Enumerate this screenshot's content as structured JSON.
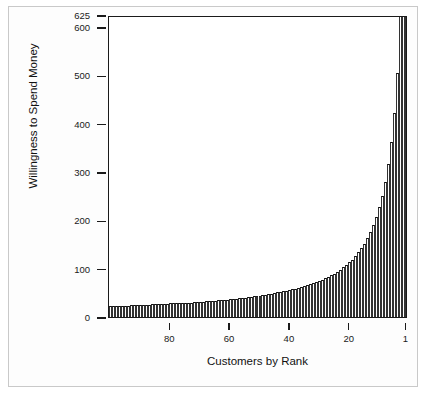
{
  "chart_data": {
    "type": "bar",
    "title": "",
    "subtitle": "",
    "xlabel": "Customers by Rank",
    "ylabel": "Willingness to Spend Money",
    "grid": false,
    "legend": "none",
    "x_axis": {
      "tick_labels": [
        "80",
        "60",
        "40",
        "20",
        "1"
      ],
      "tick_values": [
        80,
        60,
        40,
        20,
        1
      ],
      "direction": "descending",
      "range": [
        100,
        1
      ]
    },
    "y_axis": {
      "tick_labels": [
        "0",
        "100",
        "200",
        "300",
        "400",
        "500",
        "600",
        "625"
      ],
      "tick_values": [
        0,
        100,
        200,
        300,
        400,
        500,
        600,
        625
      ],
      "ylim": [
        0,
        625
      ]
    },
    "series_name": "Willingness to Spend Money",
    "categories": [
      100,
      99,
      98,
      97,
      96,
      95,
      94,
      93,
      92,
      91,
      90,
      89,
      88,
      87,
      86,
      85,
      84,
      83,
      82,
      81,
      80,
      79,
      78,
      77,
      76,
      75,
      74,
      73,
      72,
      71,
      70,
      69,
      68,
      67,
      66,
      65,
      64,
      63,
      62,
      61,
      60,
      59,
      58,
      57,
      56,
      55,
      54,
      53,
      52,
      51,
      50,
      49,
      48,
      47,
      46,
      45,
      44,
      43,
      42,
      41,
      40,
      39,
      38,
      37,
      36,
      35,
      34,
      33,
      32,
      31,
      30,
      29,
      28,
      27,
      26,
      25,
      24,
      23,
      22,
      21,
      20,
      19,
      18,
      17,
      16,
      15,
      14,
      13,
      12,
      11,
      10,
      9,
      8,
      7,
      6,
      5,
      4,
      3,
      2,
      1
    ],
    "values": [
      22,
      22,
      22,
      23,
      23,
      23,
      23,
      24,
      24,
      24,
      24,
      25,
      25,
      25,
      26,
      26,
      26,
      27,
      27,
      27,
      28,
      28,
      28,
      29,
      29,
      30,
      30,
      30,
      31,
      31,
      32,
      32,
      33,
      33,
      34,
      34,
      35,
      35,
      36,
      36,
      37,
      38,
      38,
      39,
      40,
      40,
      41,
      42,
      43,
      44,
      44,
      45,
      46,
      47,
      48,
      49,
      51,
      52,
      53,
      54,
      56,
      57,
      59,
      60,
      62,
      64,
      66,
      68,
      70,
      72,
      75,
      77,
      80,
      83,
      86,
      90,
      94,
      98,
      103,
      108,
      113,
      119,
      126,
      134,
      142,
      152,
      163,
      176,
      190,
      207,
      227,
      251,
      280,
      316,
      362,
      423,
      505,
      625,
      625,
      625
    ],
    "shaded_regions": [
      {
        "name": "low-price-revenue-rectangle",
        "color": "#6f6f6f",
        "price": 48,
        "customers_served": 40,
        "x_from_rank": 40,
        "x_to_rank": 1,
        "y_from": 0,
        "y_to": 48
      },
      {
        "name": "high-price-revenue-rectangle",
        "color": "#9a9a9a",
        "price": 200,
        "customers_served": 9,
        "x_from_rank": 9,
        "x_to_rank": 1,
        "y_from": 0,
        "y_to": 200
      }
    ]
  },
  "colors": {
    "bar_outline": "#111111",
    "bar_fill": "#ffffff",
    "axis": "#1a1a1a",
    "rect_dark": "#6f6f6f",
    "rect_light": "#9a9a9a",
    "page_background": "#ffffff",
    "outer_border": "#c9c9c9"
  }
}
